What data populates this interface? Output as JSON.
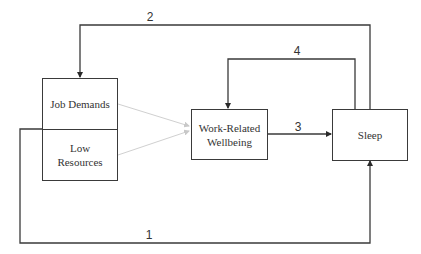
{
  "diagram": {
    "nodes": {
      "job_demands": {
        "label": "Job Demands"
      },
      "low_resources": {
        "label": "Low\nResources"
      },
      "work_wellbeing": {
        "label": "Work-Related\nWellbeing"
      },
      "sleep": {
        "label": "Sleep"
      }
    },
    "edges": [
      {
        "id": "1",
        "label": "1",
        "from": "low_resources",
        "to": "sleep"
      },
      {
        "id": "2",
        "label": "2",
        "from": "sleep",
        "to": "job_demands"
      },
      {
        "id": "3",
        "label": "3",
        "from": "work_wellbeing",
        "to": "sleep"
      },
      {
        "id": "4",
        "label": "4",
        "from": "sleep",
        "to": "work_wellbeing"
      },
      {
        "id": "jd-wb",
        "label": "",
        "from": "job_demands",
        "to": "work_wellbeing",
        "style": "gray"
      },
      {
        "id": "lr-wb",
        "label": "",
        "from": "low_resources",
        "to": "work_wellbeing",
        "style": "gray"
      }
    ],
    "colors": {
      "line": "#3a3a3a",
      "gray_arrow": "#cccccc"
    }
  }
}
